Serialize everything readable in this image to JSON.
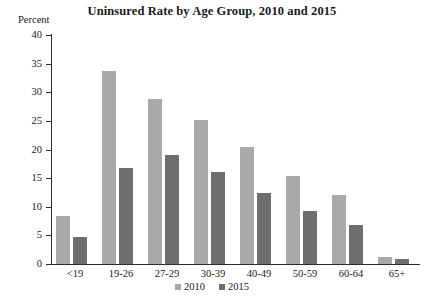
{
  "chart_data": {
    "type": "bar",
    "title": "Uninsured Rate by Age Group, 2010 and 2015",
    "xlabel": "",
    "ylabel": "Percent",
    "ylim": [
      0,
      40
    ],
    "yticks": [
      0,
      5,
      10,
      15,
      20,
      25,
      30,
      35,
      40
    ],
    "grid": false,
    "legend_position": "bottom-center",
    "categories": [
      "<19",
      "19-26",
      "27-29",
      "30-39",
      "40-49",
      "50-59",
      "60-64",
      "65+"
    ],
    "series": [
      {
        "name": "2010",
        "color": "#a9a9a9",
        "values": [
          8.3,
          33.7,
          28.8,
          25.2,
          20.4,
          15.3,
          12.1,
          1.2
        ]
      },
      {
        "name": "2015",
        "color": "#6e6e6e",
        "values": [
          4.8,
          16.7,
          19.0,
          16.0,
          12.4,
          9.2,
          6.8,
          0.9
        ]
      }
    ]
  },
  "axis": {
    "unit_label": "Percent"
  },
  "colors": {
    "axis": "#2b2b2b",
    "background": "#ffffff",
    "series_2010": "#a9a9a9",
    "series_2015": "#6e6e6e"
  }
}
